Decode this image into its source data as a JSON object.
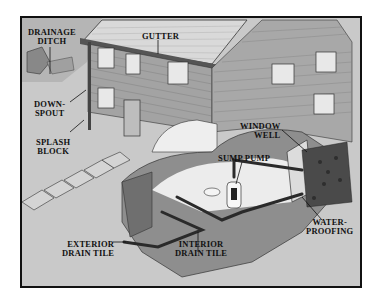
{
  "diagram": {
    "colors": {
      "background": "#c9c9c9",
      "frame": "#111111",
      "siding": "#9a9a9a",
      "roof": "#d6d6d6",
      "soil": "#8d8d8d",
      "pipe": "#2a2a2a",
      "basement_cutaway": "#ececec"
    },
    "labels": [
      {
        "id": "drainage-ditch",
        "lines": [
          "DRAINAGE",
          "DITCH"
        ]
      },
      {
        "id": "gutter",
        "lines": [
          "GUTTER"
        ]
      },
      {
        "id": "downspout",
        "lines": [
          "DOWN-",
          "SPOUT"
        ]
      },
      {
        "id": "splash-block",
        "lines": [
          "SPLASH",
          "BLOCK"
        ]
      },
      {
        "id": "window-well",
        "lines": [
          "WINDOW",
          "WELL"
        ]
      },
      {
        "id": "sump-pump",
        "lines": [
          "SUMP PUMP"
        ]
      },
      {
        "id": "waterproofing",
        "lines": [
          "WATER-",
          "PROOFING"
        ]
      },
      {
        "id": "exterior-drain-tile",
        "lines": [
          "EXTERIOR",
          "DRAIN TILE"
        ]
      },
      {
        "id": "interior-drain-tile",
        "lines": [
          "INTERIOR",
          "DRAIN TILE"
        ]
      }
    ]
  }
}
